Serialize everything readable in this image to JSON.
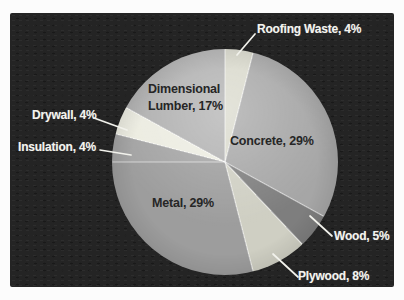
{
  "chart_data": {
    "type": "pie",
    "title": "",
    "legend": "none",
    "start_angle_deg": 0,
    "direction": "clockwise",
    "background_color": "#242424",
    "outside_label_color": "#f4f4ef",
    "inside_label_color": "#262626",
    "slices": [
      {
        "label": "Roofing Waste",
        "value": 4,
        "pct": "4%",
        "color": "#d9d9cc",
        "label_text": "Roofing Waste, 4%",
        "label_placement": "outside"
      },
      {
        "label": "Concrete",
        "value": 29,
        "pct": "29%",
        "color": "#a6a6a6",
        "label_text": "Concrete, 29%",
        "label_placement": "inside"
      },
      {
        "label": "Wood",
        "value": 5,
        "pct": "5%",
        "color": "#7e7e7e",
        "label_text": "Wood, 5%",
        "label_placement": "outside"
      },
      {
        "label": "Plywood",
        "value": 8,
        "pct": "8%",
        "color": "#cfcfc3",
        "label_text": "Plywood, 8%",
        "label_placement": "outside"
      },
      {
        "label": "Metal",
        "value": 29,
        "pct": "29%",
        "color": "#9d9d9d",
        "label_text": "Metal, 29%",
        "label_placement": "inside"
      },
      {
        "label": "Insulation",
        "value": 4,
        "pct": "4%",
        "color": "#a3a3a3",
        "label_text": "Insulation, 4%",
        "label_placement": "outside"
      },
      {
        "label": "Drywall",
        "value": 4,
        "pct": "4%",
        "color": "#ecece1",
        "label_text": "Drywall, 4%",
        "label_placement": "outside"
      },
      {
        "label": "Dimensional Lumber",
        "value": 17,
        "pct": "17%",
        "color": "#b0b0b0",
        "label_text": "Dimensional Lumber, 17%",
        "label_lines": [
          "Dimensional",
          "Lumber, 17%"
        ],
        "label_placement": "inside"
      }
    ]
  }
}
